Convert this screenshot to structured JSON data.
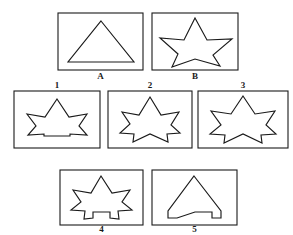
{
  "figure": {
    "background": "#ffffff",
    "ink_color": "#1a1a1a",
    "width": 293,
    "height": 235,
    "rows": [
      {
        "row_name": "stimulus-row",
        "label_position": "below",
        "panels": [
          {
            "id": "A",
            "label": "A",
            "shape_name": "triangle",
            "box": {
              "x": 58,
              "y": 13,
              "w": 85,
              "h": 57
            },
            "label_xy": {
              "x": 100.5,
              "y": 79
            },
            "points": "101,21 134,62 68,62"
          },
          {
            "id": "B",
            "label": "B",
            "shape_name": "five-point-star",
            "box": {
              "x": 152,
              "y": 13,
              "w": 86,
              "h": 57
            },
            "label_xy": {
              "x": 195,
              "y": 79
            },
            "points": "195,18 207,40 232,39 213,55 220,66 195,59 172,67 178,54 160,38 184,40"
          }
        ]
      },
      {
        "row_name": "options-row-upper",
        "label_position": "above",
        "panels": [
          {
            "id": "1",
            "label": "1",
            "shape_name": "star-flat-bottom",
            "box": {
              "x": 14,
              "y": 91,
              "w": 86,
              "h": 57
            },
            "label_xy": {
              "x": 57,
              "y": 88
            },
            "points": "57,99 69,117 87,114 79,126 87,135 70,134 70,136 44,136 44,134 28,135 36,126 27,114 45,117"
          },
          {
            "id": "2",
            "label": "2",
            "shape_name": "star-notched-bottom-narrow",
            "box": {
              "x": 108,
              "y": 91,
              "w": 84,
              "h": 57
            },
            "label_xy": {
              "x": 150,
              "y": 88
            },
            "points": "150,97 161,115 179,112 171,125 180,133 167,134 168,142 150,134 133,142 134,134 120,133 130,124 122,112 139,115"
          },
          {
            "id": "3",
            "label": "3",
            "shape_name": "star-notched-bottom-wide",
            "box": {
              "x": 198,
              "y": 91,
              "w": 90,
              "h": 57
            },
            "label_xy": {
              "x": 243,
              "y": 88
            },
            "points": "243,96 255,114 275,111 266,125 276,134 261,135 262,143 243,134 224,143 225,135 210,134 221,125 211,111 231,114"
          }
        ]
      },
      {
        "row_name": "options-row-lower",
        "label_position": "below",
        "panels": [
          {
            "id": "4",
            "label": "4",
            "shape_name": "star-with-legs",
            "box": {
              "x": 60,
              "y": 170,
              "w": 83,
              "h": 55
            },
            "label_xy": {
              "x": 101.5,
              "y": 232
            },
            "points": "101,176 112,193 130,190 122,202 132,210 118,211 119,219 110,218 110,212 93,212 93,218 84,219 85,211 71,210 81,202 73,190 91,193"
          },
          {
            "id": "5",
            "label": "5",
            "shape_name": "triangle-notched-bottom",
            "box": {
              "x": 152,
              "y": 170,
              "w": 85,
              "h": 55
            },
            "label_xy": {
              "x": 194.5,
              "y": 232
            },
            "points": "194,176 221,211 221,218 212,218 212,212 195,212 177,218 168,218 168,211"
          }
        ]
      }
    ]
  }
}
